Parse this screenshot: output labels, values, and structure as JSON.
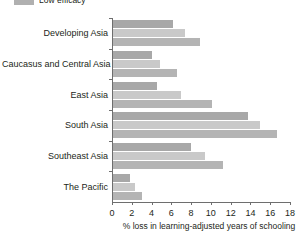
{
  "legend": {
    "items": [
      {
        "label": "Low efficacy",
        "color": "#b0b0b0",
        "icon": "legend-swatch-icon"
      }
    ]
  },
  "axis": {
    "x_title": "% loss in learning-adjusted years of schooling",
    "x_ticks": [
      "0",
      "2",
      "4",
      "6",
      "8",
      "10",
      "12",
      "14",
      "16",
      "18"
    ]
  },
  "chart_data": {
    "type": "bar",
    "orientation": "horizontal",
    "title": "",
    "xlabel": "% loss in learning-adjusted years of schooling",
    "ylabel": "",
    "xlim": [
      0,
      18
    ],
    "xticks": [
      0,
      2,
      4,
      6,
      8,
      10,
      12,
      14,
      16,
      18
    ],
    "grid": false,
    "legend_position": "top-left",
    "categories": [
      "Developing Asia",
      "Caucasus and Central Asia",
      "East Asia",
      "South Asia",
      "Southeast Asia",
      "The Pacific"
    ],
    "series": [
      {
        "name": "High efficacy",
        "color": "#a8a8a8",
        "values": [
          6.1,
          3.9,
          4.4,
          13.7,
          7.9,
          1.7
        ]
      },
      {
        "name": "Medium efficacy",
        "color": "#c9c9c9",
        "values": [
          7.3,
          4.8,
          6.9,
          14.9,
          9.3,
          2.2
        ]
      },
      {
        "name": "Low efficacy",
        "color": "#b4b4b4",
        "values": [
          8.8,
          6.5,
          10.0,
          16.6,
          11.1,
          2.9
        ]
      }
    ]
  }
}
